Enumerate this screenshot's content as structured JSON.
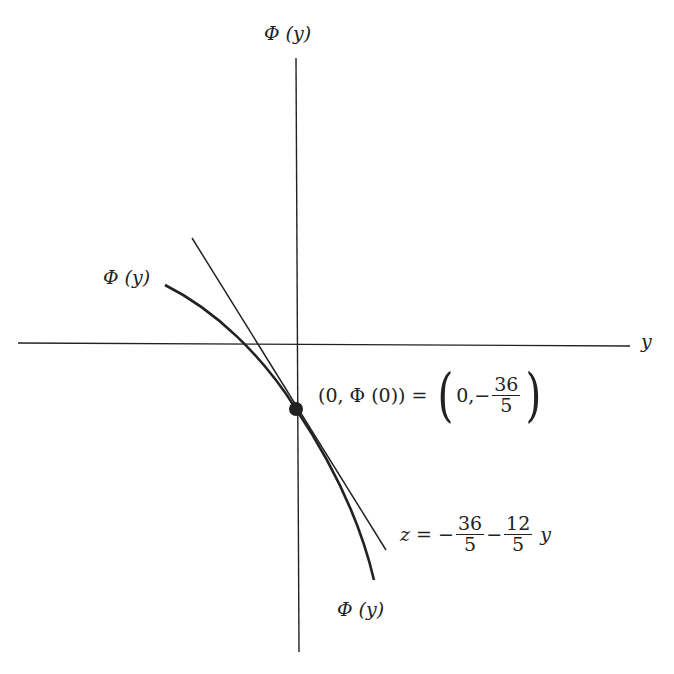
{
  "diagram": {
    "axes": {
      "vertical_label": "Φ (y)",
      "horizontal_label": "y"
    },
    "curve": {
      "label_upper": "Φ (y)",
      "label_lower": "Φ (y)"
    },
    "point": {
      "label_left": "(0, Φ (0)) =",
      "x_value": "0,",
      "minus": "−",
      "numerator": "36",
      "denominator": "5"
    },
    "tangent": {
      "lhs": "z =",
      "minus1": "−",
      "frac1_num": "36",
      "frac1_den": "5",
      "minus2": "−",
      "frac2_num": "12",
      "frac2_den": "5",
      "var": "y"
    },
    "colors": {
      "line": "#222222",
      "background": "#ffffff"
    }
  }
}
